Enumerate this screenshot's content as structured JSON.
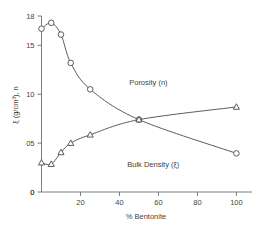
{
  "page_header": {
    "text": "",
    "visible": false
  },
  "chart_data": {
    "type": "line",
    "title": "",
    "subtitle": "",
    "xlabel": "% Bentonite",
    "ylabel": "ξ (g/cm³), n",
    "xlim": [
      0,
      108
    ],
    "ylim": [
      0,
      18
    ],
    "xticks": [
      0,
      20,
      40,
      60,
      80,
      100
    ],
    "xticklabels": [
      "0",
      "20",
      "40",
      "60",
      "80",
      "100"
    ],
    "yticks": [
      0,
      5,
      10,
      15,
      18
    ],
    "yticklabels": [
      "0",
      "05",
      "10",
      "15",
      "18"
    ],
    "grid": false,
    "legend_position": "inline-annotations",
    "series": [
      {
        "name": "Porosity (n)",
        "marker": "circle",
        "annotation": "Porosity (n)",
        "annotation_x": 45,
        "annotation_y": 10.9,
        "x": [
          0,
          5,
          10,
          15,
          25,
          50,
          100
        ],
        "y": [
          16.7,
          17.3,
          16.1,
          13.2,
          10.5,
          7.4,
          3.95
        ]
      },
      {
        "name": "Bulk Density (ξ)",
        "marker": "triangle",
        "annotation": "Bulk Density (ξ)",
        "annotation_x": 44,
        "annotation_y": 2.55,
        "x": [
          0,
          5,
          10,
          15,
          25,
          50,
          100
        ],
        "y": [
          3.0,
          2.85,
          4.05,
          5.0,
          5.85,
          7.4,
          8.7
        ]
      }
    ]
  },
  "colors": {
    "axis": "#6e6e6e",
    "curve": "#4a4a4a",
    "text": "#3f3f3f",
    "marker_fill": "#ffffff",
    "background": "#ffffff"
  }
}
